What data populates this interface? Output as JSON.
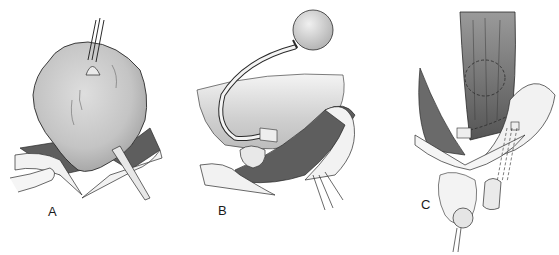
{
  "figure": {
    "panels": [
      {
        "id": "A",
        "label": "A",
        "description": "Bladder dome grasped with forceps at apex, surgical wound edges retracted"
      },
      {
        "id": "B",
        "label": "B",
        "description": "Catheter with inflated balloon reservoir and tubing placed through incision"
      },
      {
        "id": "C",
        "label": "C",
        "description": "Retracted tissue with dashed outline of internal device and tubing leading to scrotal pump"
      }
    ],
    "colors": {
      "organ_fill": "#c9c9c9",
      "tissue_dark": "#5e5e5e",
      "line": "#2a2a2a",
      "background": "#ffffff"
    }
  }
}
